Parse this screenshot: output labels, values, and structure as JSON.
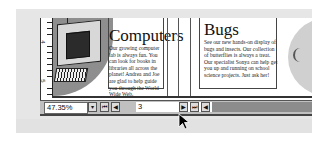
{
  "document": {
    "panels": [
      {
        "title": "Computers",
        "body": "Our growing computer lab is always fun. You can look for books in libraries all across the planet! Andrea and Joe are glad to help guide you through the World Wide Web."
      },
      {
        "title": "Bugs",
        "body": "See our new hands-on display of bugs and insects. Our collection of butterflies is always a treat. Our specialist Sonya can help get you up and running on school science projects. Just ask her!"
      }
    ],
    "ruler_labels": [
      "4",
      "5"
    ]
  },
  "statusbar": {
    "zoom_value": "47.35%",
    "zoom_dropdown_icon": "▾",
    "first_page_icon": "⏮",
    "prev_page_icon": "◀",
    "page_number": "3",
    "next_page_icon": "▶",
    "last_page_icon": "⏭",
    "extra_prev_icon": "◀"
  },
  "colors": {
    "status_bg": "#c0c0c0",
    "scroll_track": "#8c8c8c",
    "frame_bg": "#e6e6e6"
  }
}
